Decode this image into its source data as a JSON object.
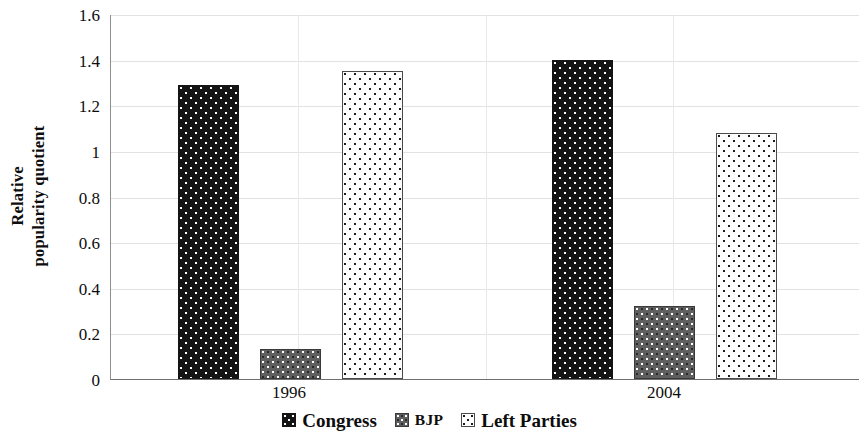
{
  "chart_data": {
    "type": "bar",
    "title": "",
    "subtitle": "",
    "xlabel": "",
    "ylabel": "Relative popularity quotient",
    "ylabel_lines": [
      "Relative",
      "popularity quotient"
    ],
    "categories": [
      "1996",
      "2004"
    ],
    "series": [
      {
        "name": "Congress",
        "values": [
          1.29,
          1.4
        ]
      },
      {
        "name": "BJP",
        "values": [
          0.13,
          0.32
        ]
      },
      {
        "name": "Left Parties",
        "values": [
          1.35,
          1.08
        ]
      }
    ],
    "ylim": [
      0,
      1.6
    ],
    "ytick_labels": [
      "0",
      "0.2",
      "0.4",
      "0.6",
      "0.8",
      "1",
      "1.2",
      "1.4",
      "1.6"
    ],
    "ytick_values": [
      0,
      0.2,
      0.4,
      0.6,
      0.8,
      1,
      1.2,
      1.4,
      1.6
    ],
    "grid": "horizontal-and-vertical",
    "legend_position": "bottom-center",
    "legend": [
      {
        "label": "Congress",
        "pattern": "black-with-white-dots",
        "color": "#141414"
      },
      {
        "label": "BJP",
        "pattern": "gray-checkered-dots",
        "color": "#5f5f5f"
      },
      {
        "label": "Left Parties",
        "pattern": "white-with-black-dots",
        "color": "#fdfdfd"
      }
    ],
    "annotations": []
  },
  "axes": {
    "y_title_line1": "Relative",
    "y_title_line2": "popularity quotient",
    "y_ticks": [
      "1.6",
      "1.4",
      "1.2",
      "1",
      "0.8",
      "0.6",
      "0.4",
      "0.2",
      "0"
    ],
    "x_categories": [
      "1996",
      "2004"
    ]
  },
  "legend": {
    "items": [
      {
        "label": "Congress"
      },
      {
        "label": "BJP"
      },
      {
        "label": "Left Parties"
      }
    ]
  }
}
